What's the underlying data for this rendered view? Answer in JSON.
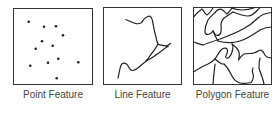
{
  "figure": {
    "panels": [
      {
        "id": "point",
        "label": "Point Feature",
        "frame": {
          "x": 13,
          "y": 8,
          "w": 80,
          "h": 77
        },
        "points": [
          [
            28.7,
            21.7
          ],
          [
            44,
            26.7
          ],
          [
            56,
            26.3
          ],
          [
            63,
            35.3
          ],
          [
            42,
            41.3
          ],
          [
            52.7,
            45.7
          ],
          [
            35.7,
            48.7
          ],
          [
            58.3,
            58.7
          ],
          [
            48,
            62.7
          ],
          [
            78.3,
            62.3
          ],
          [
            30.3,
            65.7
          ],
          [
            56.7,
            78.3
          ]
        ]
      },
      {
        "id": "line",
        "label": "Line Feature",
        "frame": {
          "x": 103,
          "y": 7,
          "w": 79,
          "h": 78
        }
      },
      {
        "id": "polygon",
        "label": "Polygon Feature",
        "frame": {
          "x": 193,
          "y": 7,
          "w": 79,
          "h": 78
        }
      }
    ],
    "colors": {
      "stroke": "#222222",
      "frame": "#333333",
      "label": "#444444",
      "background": "#ffffff"
    }
  }
}
